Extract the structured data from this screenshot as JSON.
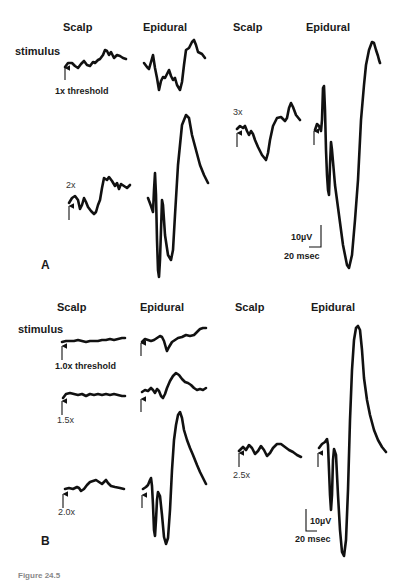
{
  "figure": {
    "caption_partial": "Figure 24.5",
    "panels": [
      {
        "letter": "A",
        "column_headers": [
          "Scalp",
          "Epidural",
          "Scalp",
          "Epidural"
        ],
        "stimulus_label": "stimulus",
        "conditions": [
          {
            "label": "1x threshold",
            "scalp": "small noisy response",
            "epidural": "small polyphasic response"
          },
          {
            "label": "2x",
            "scalp": "small response",
            "epidural": "large biphasic response"
          },
          {
            "label": "3x",
            "scalp": "moderate response",
            "epidural": "very large biphasic response"
          }
        ],
        "scale_bar": {
          "amplitude": "10µV",
          "time": "20 msec"
        }
      },
      {
        "letter": "B",
        "column_headers": [
          "Scalp",
          "Epidural",
          "Scalp",
          "Epidural"
        ],
        "stimulus_label": "stimulus",
        "conditions": [
          {
            "label": "1.0x threshold",
            "scalp": "flat",
            "epidural": "small response"
          },
          {
            "label": "1.5x",
            "scalp": "flat",
            "epidural": "small-moderate response"
          },
          {
            "label": "2.0x",
            "scalp": "small response",
            "epidural": "large biphasic response"
          },
          {
            "label": "2.5x",
            "scalp": "small response",
            "epidural": "very large biphasic response"
          }
        ],
        "scale_bar": {
          "amplitude": "10µV",
          "time": "20 msec"
        }
      }
    ]
  },
  "labels": {
    "a_scalp_1": "Scalp",
    "a_epidural_1": "Epidural",
    "a_scalp_2": "Scalp",
    "a_epidural_2": "Epidural",
    "a_stimulus": "stimulus",
    "a_1x": "1x threshold",
    "a_2x": "2x",
    "a_3x": "3x",
    "a_scale_amp": "10µV",
    "a_scale_time": "20 msec",
    "a_letter": "A",
    "b_scalp_1": "Scalp",
    "b_epidural_1": "Epidural",
    "b_scalp_2": "Scalp",
    "b_epidural_2": "Epidural",
    "b_stimulus": "stimulus",
    "b_10x": "1.0x threshold",
    "b_15x": "1.5x",
    "b_20x": "2.0x",
    "b_25x": "2.5x",
    "b_scale_amp": "10µV",
    "b_scale_time": "20 msec",
    "b_letter": "B",
    "caption": "Figure 24.5"
  }
}
